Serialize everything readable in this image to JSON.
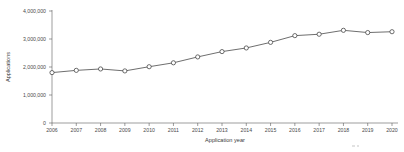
{
  "chart_data": {
    "type": "line",
    "title": "",
    "xlabel": "Application year",
    "ylabel": "Applications",
    "categories": [
      "2006",
      "2007",
      "2008",
      "2009",
      "2010",
      "2011",
      "2012",
      "2013",
      "2014",
      "2015",
      "2016",
      "2017",
      "2018",
      "2019",
      "2020"
    ],
    "values": [
      1800000,
      1880000,
      1930000,
      1860000,
      2010000,
      2150000,
      2360000,
      2550000,
      2680000,
      2880000,
      3120000,
      3170000,
      3310000,
      3230000,
      3260000
    ],
    "series": [
      {
        "name": "Applications",
        "values": [
          1800000,
          1880000,
          1930000,
          1860000,
          2010000,
          2150000,
          2360000,
          2550000,
          2680000,
          2880000,
          3120000,
          3170000,
          3310000,
          3230000,
          3260000
        ]
      }
    ],
    "ylim": [
      0,
      4000000
    ],
    "ytick_labels": [
      "0",
      "1,000,000",
      "2,000,000",
      "3,000,000",
      "4,000,000"
    ],
    "ytick_values": [
      0,
      1000000,
      2000000,
      3000000,
      4000000
    ],
    "xtick_labels": [
      "2006",
      "2007",
      "2008",
      "2009",
      "2010",
      "2011",
      "2012",
      "2013",
      "2014",
      "2015",
      "2016",
      "2017",
      "2018",
      "2019",
      "2020"
    ],
    "grid": false,
    "legend": "none",
    "marker": "open-circle",
    "line_color": "#3d3d3d",
    "marker_fill": "#ffffff",
    "axis_color": "#5a5a5a",
    "background": "#ffffff",
    "axis_style": "left-and-bottom-only"
  }
}
